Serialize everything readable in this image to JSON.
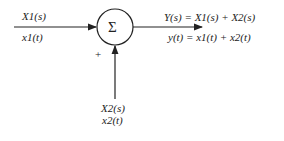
{
  "diagram": {
    "type": "summing-junction",
    "junction_symbol": "Σ",
    "input1": {
      "laplace": "X1(s)",
      "time": "x1(t)"
    },
    "input2": {
      "laplace": "X2(s)",
      "time": "x2(t)",
      "sign": "+"
    },
    "output": {
      "laplace": "Y(s) = X1(s) + X2(s)",
      "time": "y(t) = x1(t) + x2(t)"
    }
  }
}
